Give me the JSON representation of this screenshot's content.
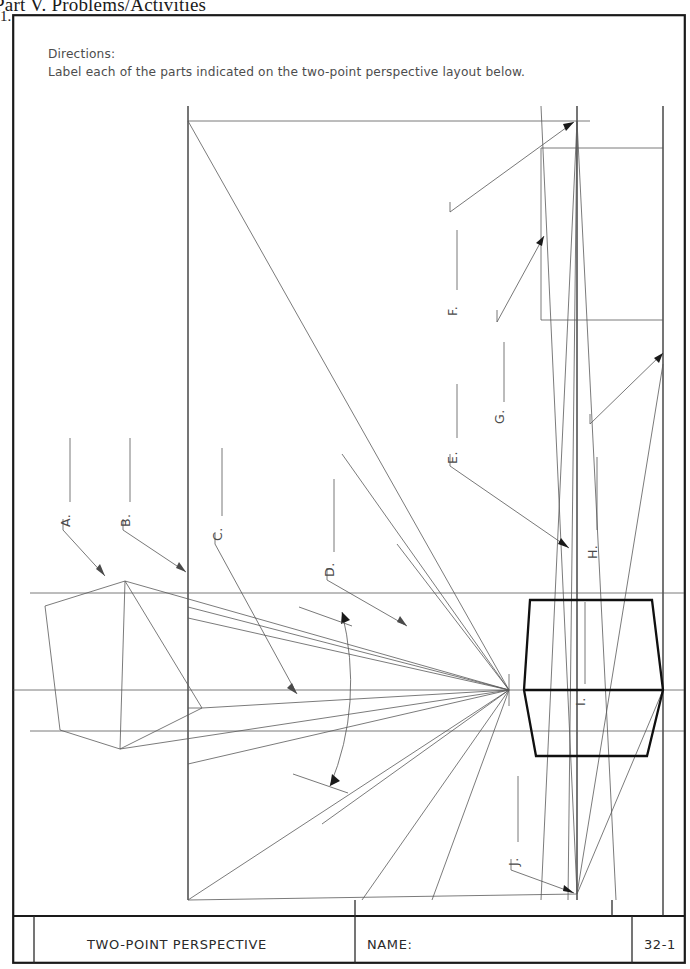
{
  "page": {
    "section_header": "Part V. Problems/Activities",
    "problem_number": "1."
  },
  "directions": {
    "heading": "Directions:",
    "body": "Label each of the parts indicated on the two-point perspective layout below."
  },
  "drawing": {
    "kind": "two-point-perspective-layout",
    "labels": [
      {
        "id": "A",
        "text": "A."
      },
      {
        "id": "B",
        "text": "B."
      },
      {
        "id": "C",
        "text": "C."
      },
      {
        "id": "D",
        "text": "D."
      },
      {
        "id": "E",
        "text": "E."
      },
      {
        "id": "F",
        "text": "F."
      },
      {
        "id": "G",
        "text": "G."
      },
      {
        "id": "H",
        "text": "H."
      },
      {
        "id": "I",
        "text": "I."
      },
      {
        "id": "J",
        "text": "J."
      }
    ]
  },
  "title_block": {
    "drawing_title": "TWO-POINT PERSPECTIVE",
    "name_label": "NAME:",
    "sheet_number": "32-1"
  },
  "colors": {
    "paper": "#ffffff",
    "ink": "#1a1a1a",
    "construction_line": "#595959",
    "object_line": "#101010",
    "label_text": "#4a4a4a"
  }
}
